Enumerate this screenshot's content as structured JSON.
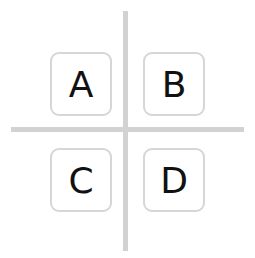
{
  "diagram": {
    "type": "quadrant-grid",
    "colors": {
      "divider": "#d2d2d2",
      "box_border": "#d6d6d6",
      "text": "#111111",
      "background": "#ffffff"
    },
    "quadrants": [
      {
        "position": "top-left",
        "label": "A"
      },
      {
        "position": "top-right",
        "label": "B"
      },
      {
        "position": "bottom-left",
        "label": "C"
      },
      {
        "position": "bottom-right",
        "label": "D"
      }
    ]
  }
}
